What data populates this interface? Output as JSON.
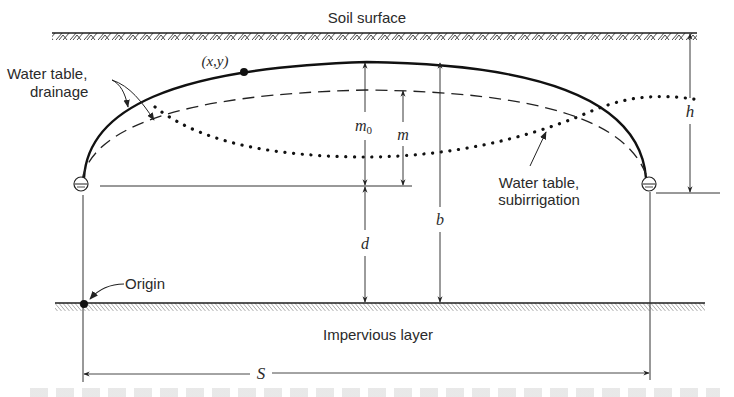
{
  "diagram": {
    "type": "cross-section",
    "labels": {
      "soil_surface": "Soil surface",
      "impervious_layer": "Impervious layer",
      "water_table_drainage_line1": "Water table,",
      "water_table_drainage_line2": "drainage",
      "water_table_subirrigation_line1": "Water table,",
      "water_table_subirrigation_line2": "subirrigation",
      "origin": "Origin",
      "point": "(x,y)"
    },
    "dimensions": {
      "m0": "m",
      "m0_subscript": "0",
      "m": "m",
      "d": "d",
      "b": "b",
      "h": "h",
      "S": "S"
    },
    "layers": [
      {
        "name": "soil-surface",
        "hatch": "chevron"
      },
      {
        "name": "impervious-layer",
        "hatch": "diagonal"
      }
    ],
    "curves": [
      {
        "name": "water-table-drainage-solid",
        "style": "solid"
      },
      {
        "name": "water-table-drainage-dashed",
        "style": "dashed"
      },
      {
        "name": "water-table-subirrigation",
        "style": "dotted"
      }
    ],
    "drains": [
      "left-drain",
      "right-drain"
    ],
    "colors": {
      "ink": "#1e1e1e",
      "background": "#ffffff"
    }
  }
}
